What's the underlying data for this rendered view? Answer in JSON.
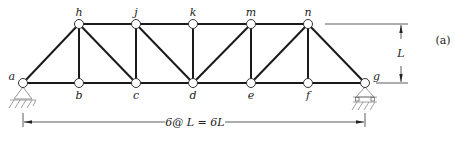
{
  "figure": {
    "panel_label": "(a)",
    "span_label": "6@ L = 6L",
    "height_label": "L"
  },
  "nodes": [
    {
      "id": "a",
      "x": 23,
      "y": 83,
      "label_pos": "left"
    },
    {
      "id": "b",
      "x": 79,
      "y": 83,
      "label_pos": "below"
    },
    {
      "id": "c",
      "x": 136,
      "y": 83,
      "label_pos": "below"
    },
    {
      "id": "d",
      "x": 193,
      "y": 83,
      "label_pos": "below"
    },
    {
      "id": "e",
      "x": 251,
      "y": 83,
      "label_pos": "below"
    },
    {
      "id": "f",
      "x": 308,
      "y": 83,
      "label_pos": "below"
    },
    {
      "id": "g",
      "x": 365,
      "y": 83,
      "label_pos": "right"
    },
    {
      "id": "h",
      "x": 79,
      "y": 24,
      "label_pos": "above"
    },
    {
      "id": "j",
      "x": 136,
      "y": 24,
      "label_pos": "above"
    },
    {
      "id": "k",
      "x": 193,
      "y": 24,
      "label_pos": "above"
    },
    {
      "id": "m",
      "x": 251,
      "y": 24,
      "label_pos": "above"
    },
    {
      "id": "n",
      "x": 308,
      "y": 24,
      "label_pos": "above"
    }
  ],
  "members": [
    [
      "a",
      "b"
    ],
    [
      "b",
      "c"
    ],
    [
      "c",
      "d"
    ],
    [
      "d",
      "e"
    ],
    [
      "e",
      "f"
    ],
    [
      "f",
      "g"
    ],
    [
      "h",
      "j"
    ],
    [
      "j",
      "k"
    ],
    [
      "k",
      "m"
    ],
    [
      "m",
      "n"
    ],
    [
      "a",
      "h"
    ],
    [
      "n",
      "g"
    ],
    [
      "h",
      "b"
    ],
    [
      "j",
      "c"
    ],
    [
      "k",
      "d"
    ],
    [
      "m",
      "e"
    ],
    [
      "n",
      "f"
    ],
    [
      "h",
      "c"
    ],
    [
      "j",
      "d"
    ],
    [
      "d",
      "m"
    ],
    [
      "e",
      "n"
    ]
  ],
  "supports": [
    {
      "node": "a",
      "type": "pin"
    },
    {
      "node": "g",
      "type": "roller"
    }
  ]
}
